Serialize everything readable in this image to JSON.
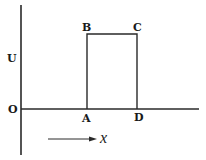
{
  "diagram": {
    "type": "potential-barrier",
    "axis_labels": {
      "vertical": "U",
      "origin": "O",
      "horizontal_direction": "x"
    },
    "points": [
      {
        "label": "A",
        "role": "barrier-left-bottom"
      },
      {
        "label": "B",
        "role": "barrier-left-top"
      },
      {
        "label": "C",
        "role": "barrier-right-top"
      },
      {
        "label": "D",
        "role": "barrier-right-bottom"
      }
    ],
    "colors": {
      "line": "#2a2a2a",
      "text": "#1a1a1a",
      "background": "#ffffff"
    }
  }
}
